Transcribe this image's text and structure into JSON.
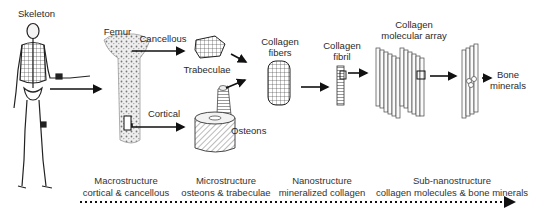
{
  "diagram": {
    "nodes": {
      "skeleton": "Skeleton",
      "femur": "Femur",
      "cancellous": "Cancellous",
      "cortical": "Cortical",
      "trabeculae": "Trabeculae",
      "osteons": "Osteons",
      "collagen_fibers": [
        "Collagen",
        "fibers"
      ],
      "collagen_fibril": [
        "Collagen",
        "fibril"
      ],
      "collagen_array": [
        "Collagen",
        "molecular array"
      ],
      "bone_minerals": [
        "Bone",
        "minerals"
      ]
    },
    "scale_levels": [
      {
        "level": "Macrostructure",
        "detail": "cortical & cancellous"
      },
      {
        "level": "Microstructure",
        "detail": "osteons & trabeculae"
      },
      {
        "level": "Nanostructure",
        "detail": "mineralized collagen"
      },
      {
        "level": "Sub-nanostructure",
        "detail": "collagen molecules & bone minerals"
      }
    ],
    "colors": {
      "ink": "#111111",
      "text": "#2a2a2a",
      "fill_light": "#e8e8e8"
    }
  }
}
